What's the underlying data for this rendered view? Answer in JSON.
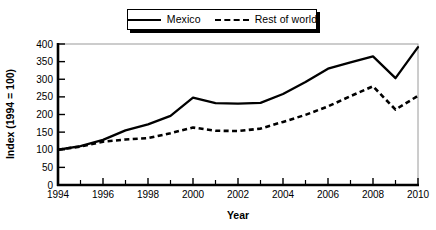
{
  "chart_data": {
    "type": "line",
    "title": "",
    "xlabel": "Year",
    "ylabel": "Index (1994 = 100)",
    "xlim": [
      1994,
      2010
    ],
    "ylim": [
      0,
      400
    ],
    "grid": false,
    "legend_position": "top-center",
    "y_ticks": [
      0,
      50,
      100,
      150,
      200,
      250,
      300,
      350,
      400
    ],
    "y_tick_labels": [
      "0",
      "50",
      "100",
      "150",
      "200",
      "250",
      "300",
      "350",
      "400"
    ],
    "x_ticks": [
      1994,
      1996,
      1998,
      2000,
      2002,
      2004,
      2006,
      2008,
      2010
    ],
    "x_tick_labels": [
      "1994",
      "1996",
      "1998",
      "2000",
      "2002",
      "2004",
      "2006",
      "2008",
      "2010"
    ],
    "x_minor_ticks": [
      1995,
      1997,
      1999,
      2001,
      2003,
      2005,
      2007,
      2009
    ],
    "x": [
      1994,
      1995,
      1996,
      1997,
      1998,
      1999,
      2000,
      2001,
      2002,
      2003,
      2004,
      2005,
      2006,
      2007,
      2008,
      2009,
      2010
    ],
    "series": [
      {
        "name": "Mexico",
        "style": "solid",
        "color": "#000000",
        "values": [
          100,
          110,
          128,
          155,
          172,
          196,
          248,
          232,
          231,
          233,
          258,
          292,
          330,
          348,
          365,
          303,
          391
        ]
      },
      {
        "name": "Rest of world",
        "style": "dashed",
        "color": "#000000",
        "values": [
          100,
          109,
          123,
          129,
          133,
          147,
          163,
          154,
          153,
          160,
          179,
          199,
          223,
          252,
          280,
          214,
          253
        ]
      }
    ]
  },
  "legend": {
    "items": [
      {
        "label": "Mexico",
        "style": "solid"
      },
      {
        "label": "Rest of world",
        "style": "dashed"
      }
    ]
  },
  "axes": {
    "x_title": "Year",
    "y_title": "Index (1994 = 100)"
  }
}
